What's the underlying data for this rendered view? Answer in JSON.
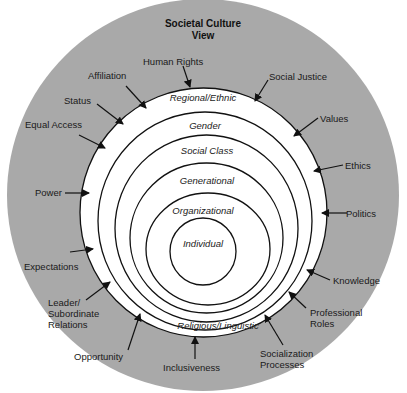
{
  "title": {
    "line1": "Societal Culture",
    "line2": "View"
  },
  "rings": [
    {
      "label": "Regional/Ethnic"
    },
    {
      "label": "Gender"
    },
    {
      "label": "Social Class"
    },
    {
      "label": "Generational"
    },
    {
      "label": "Organizational"
    },
    {
      "label": "Individual"
    },
    {
      "label": "Religious/Linguistic"
    }
  ],
  "outer_labels": {
    "human_rights": "Human Rights",
    "affiliation": "Affiliation",
    "status": "Status",
    "equal_access": "Equal Access",
    "power": "Power",
    "expectations": "Expectations",
    "leader_1": "Leader/",
    "leader_2": "Subordinate",
    "leader_3": "Relations",
    "opportunity": "Opportunity",
    "inclusiveness": "Inclusiveness",
    "socialization_1": "Socialization",
    "socialization_2": "Processes",
    "professional_1": "Professional",
    "professional_2": "Roles",
    "knowledge": "Knowledge",
    "politics": "Politics",
    "ethics": "Ethics",
    "values": "Values",
    "social_justice": "Social Justice"
  },
  "colors": {
    "outer_ring": "#a9a9a9",
    "inner": "#ffffff",
    "lines": "#111111"
  }
}
